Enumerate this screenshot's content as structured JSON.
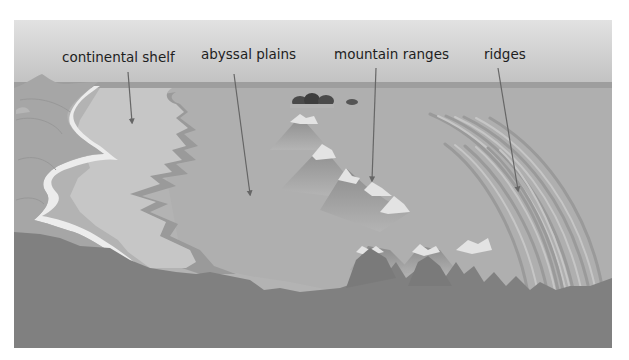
{
  "diagram": {
    "title": "",
    "labels": [
      {
        "id": "continental-shelf",
        "text": "continental shelf"
      },
      {
        "id": "abyssal-plains",
        "text": "abyssal plains"
      },
      {
        "id": "mountain-ranges",
        "text": "mountain ranges"
      },
      {
        "id": "ridges",
        "text": "ridges"
      }
    ],
    "colors": {
      "sky_top": "#dcdcdc",
      "sky_bottom": "#bdbdbd",
      "horizon_band": "#9a9a9a",
      "sea_surface": "#b8b8b8",
      "shelf": "#c4c4c4",
      "beach": "#ececec",
      "land": "#a6a6a6",
      "abyss": "#adadad",
      "slope_dark": "#8e8e8e",
      "mountain_light": "#e3e3e3",
      "mountain_mid": "#9c9c9c",
      "bedrock": "#7f7f7f",
      "arrow": "#666666",
      "islands": "#4a4a4a"
    }
  }
}
